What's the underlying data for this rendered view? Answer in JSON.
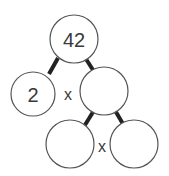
{
  "diagram": {
    "type": "factor-tree",
    "nodes": [
      {
        "id": "root",
        "value": "42",
        "cx": 74,
        "cy": 39,
        "r": 24
      },
      {
        "id": "left",
        "value": "2",
        "cx": 33,
        "cy": 94,
        "r": 22
      },
      {
        "id": "right",
        "value": "",
        "cx": 104,
        "cy": 91,
        "r": 24
      },
      {
        "id": "bottom-left",
        "value": "",
        "cx": 70,
        "cy": 144,
        "r": 24
      },
      {
        "id": "bottom-right",
        "value": "",
        "cx": 134,
        "cy": 144,
        "r": 24
      }
    ],
    "operators": [
      {
        "symbol": "x",
        "x": 68,
        "y": 94
      },
      {
        "symbol": "x",
        "x": 102,
        "y": 146
      }
    ]
  }
}
